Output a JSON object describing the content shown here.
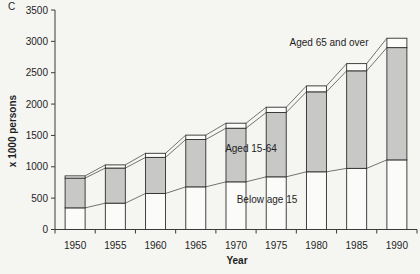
{
  "page": {
    "panel_label": "C"
  },
  "chart_data": {
    "type": "bar",
    "stacked": true,
    "title": "",
    "xlabel": "Year",
    "ylabel": "x 1000 persons",
    "categories": [
      "1950",
      "1955",
      "1960",
      "1965",
      "1970",
      "1975",
      "1980",
      "1985",
      "1990"
    ],
    "series": [
      {
        "name": "Below age 15",
        "values": [
          345,
          420,
          575,
          680,
          760,
          840,
          920,
          975,
          1110
        ],
        "fill": "#fbfbf9"
      },
      {
        "name": "Aged 15-64",
        "values": [
          475,
          560,
          575,
          755,
          855,
          1025,
          1275,
          1555,
          1790
        ],
        "fill": "#c8c8c6"
      },
      {
        "name": "Aged 65 and over",
        "values": [
          35,
          50,
          65,
          70,
          80,
          85,
          95,
          115,
          150
        ],
        "fill": "#fbfbf9"
      }
    ],
    "totals": [
      855,
      1030,
      1215,
      1505,
      1695,
      1950,
      2290,
      2645,
      3050
    ],
    "ylim": [
      0,
      3500
    ],
    "ytick_step": 500,
    "grid": false,
    "legend": "none",
    "series_lines": true,
    "annotations": [
      {
        "text": "Aged 65 and over",
        "x": 329,
        "y": 46
      },
      {
        "text": "Aged 15-64",
        "x": 251,
        "y": 152
      },
      {
        "text": "Below age 15",
        "x": 267,
        "y": 203
      }
    ],
    "colors": {
      "axis": "#3a3a3a",
      "bar_border": "#2f2f2f",
      "series_line": "#3a3a3a",
      "text": "#1e1e1e"
    }
  }
}
